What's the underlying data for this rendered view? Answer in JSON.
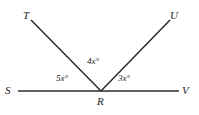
{
  "figure": {
    "background_color": "#ffffff",
    "stroke_color": "#2b2b2b",
    "text_color": "#1a1a1a"
  },
  "points": {
    "T": "T",
    "U": "U",
    "S": "S",
    "V": "V",
    "R": "R"
  },
  "angles": {
    "left": "5x°",
    "middle": "4x°",
    "right": "3x°"
  },
  "geometry": {
    "vertex": {
      "x": 101,
      "y": 91
    },
    "segments": [
      {
        "name": "line-SV",
        "x1": 18,
        "y1": 91,
        "x2": 179,
        "y2": 91
      },
      {
        "name": "ray-RT",
        "x1": 101,
        "y1": 91,
        "x2": 31,
        "y2": 20
      },
      {
        "name": "ray-RU",
        "x1": 101,
        "y1": 91,
        "x2": 170,
        "y2": 20
      }
    ],
    "stroke_width": 1.5
  }
}
